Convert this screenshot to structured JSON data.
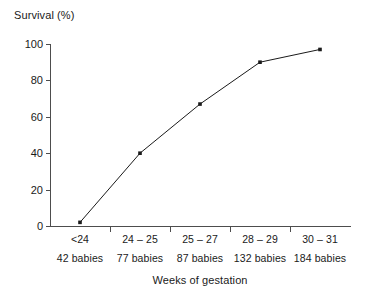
{
  "chart_data": {
    "type": "line",
    "title": "",
    "ylabel": "Survival (%)",
    "xlabel": "Weeks of gestation",
    "categories": [
      "<24",
      "24 – 25",
      "25 – 27",
      "28 – 29",
      "30 – 31"
    ],
    "group_sizes": [
      "42 babies",
      "77 babies",
      "87 babies",
      "132 babies",
      "184 babies"
    ],
    "values": [
      2,
      40,
      67,
      90,
      97
    ],
    "ylim": [
      0,
      100
    ],
    "yticks": [
      0,
      20,
      40,
      60,
      80,
      100
    ],
    "ytick_labels": [
      "0",
      "20",
      "40",
      "60",
      "80",
      "100"
    ],
    "grid": false,
    "legend": "none",
    "marker": "square",
    "line_color": "#1a1a1a",
    "marker_color": "#1a1a1a"
  }
}
